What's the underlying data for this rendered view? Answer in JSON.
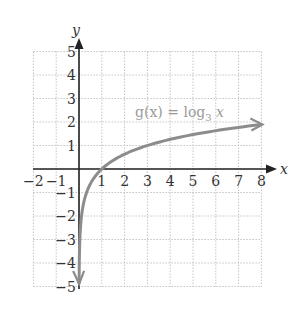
{
  "chart_data": {
    "type": "line",
    "title": "",
    "xlabel": "x",
    "ylabel": "y",
    "xlim": [
      -2,
      8
    ],
    "ylim": [
      -5,
      5
    ],
    "grid": true,
    "x_ticks": [
      -2,
      -1,
      1,
      2,
      3,
      4,
      5,
      6,
      7,
      8
    ],
    "y_ticks": [
      -5,
      -4,
      -3,
      -2,
      -1,
      1,
      2,
      3,
      4,
      5
    ],
    "x_tick_labels": [
      "−2",
      "−1",
      "1",
      "2",
      "3",
      "4",
      "5",
      "6",
      "7",
      "8"
    ],
    "y_tick_labels": [
      "−5",
      "−4",
      "−3",
      "−2",
      "−1",
      "1",
      "2",
      "3",
      "4",
      "5"
    ],
    "series": [
      {
        "name": "g(x) = log_3 x",
        "function": "log base 3 of x",
        "x": [
          0.0045,
          0.0123,
          0.037,
          0.111,
          0.333,
          1,
          3,
          8
        ],
        "y": [
          -4.9,
          -4,
          -3,
          -2,
          -1,
          0,
          1,
          1.89
        ],
        "color": "#8c8c8c",
        "arrow_ends": true
      }
    ],
    "annotations": [
      {
        "text": "g(x) = log",
        "subscript": "3",
        "suffix": " x",
        "x": 2.5,
        "y": 2.4
      }
    ]
  },
  "labels": {
    "x_axis": "x",
    "y_axis": "y",
    "function_prefix": "g(x) = log",
    "function_base": "3",
    "function_suffix": " x"
  },
  "colors": {
    "axis": "#222222",
    "grid": "#c4c4c4",
    "curve": "#8c8c8c",
    "label": "#9a9a9a"
  }
}
